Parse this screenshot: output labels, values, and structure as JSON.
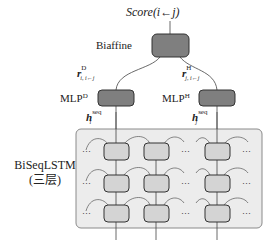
{
  "diagram": {
    "type": "neural-architecture",
    "output_label": "Score(i←j)",
    "scorer": {
      "label": "Biaffine"
    },
    "mlps": [
      {
        "label": "MLP",
        "superscript": "D",
        "output_vector": "r",
        "output_sup": "D",
        "output_sub": "i, i←j"
      },
      {
        "label": "MLP",
        "superscript": "H",
        "output_vector": "r",
        "output_sup": "H",
        "output_sub": "j, i←j"
      }
    ],
    "encoder_inputs": [
      {
        "vector": "h",
        "sup": "seq",
        "sub": "i"
      },
      {
        "vector": "h",
        "sup": "seq",
        "sub": "j"
      }
    ],
    "encoder": {
      "label": "BiSeqLSTM",
      "sublabel": "(三层)",
      "layers": 3,
      "visible_cells_per_layer": 3,
      "ellipsis": "···"
    },
    "colors": {
      "node_dark": "#7f7f7f",
      "node_light": "#d4d4d4",
      "encoder_bg": "#ececec",
      "stroke": "#333333"
    }
  }
}
